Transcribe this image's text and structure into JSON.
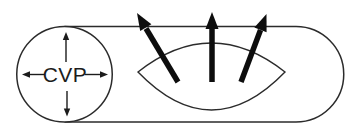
{
  "diagram": {
    "label": "CVP",
    "icons": {
      "vessel": "rounded-tube-outline",
      "left_cap": "circle-cross-section",
      "pressure_arrows": [
        "arrow-up-icon",
        "arrow-down-icon",
        "arrow-left-icon",
        "arrow-right-icon"
      ],
      "lens": "eye-lens-shape",
      "outward_arrows": [
        "thick-arrow-up-left-icon",
        "thick-arrow-up-icon",
        "thick-arrow-up-right-icon"
      ]
    }
  },
  "colors": {
    "background": "#ffffff",
    "line": "#2b2b2b",
    "arrow": "#0d0d0d",
    "text": "#1c1c1c"
  }
}
